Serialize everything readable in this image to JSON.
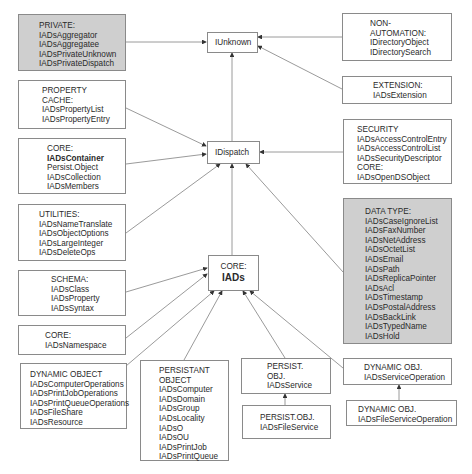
{
  "diagram": {
    "colors": {
      "gray_box": "#cfcfcf",
      "border": "#8a8a8a",
      "line": "#808080"
    },
    "nodes": {
      "iunknown": {
        "lines": [
          "IUnknown"
        ]
      },
      "idispatch": {
        "lines": [
          "IDispatch"
        ]
      },
      "iads": {
        "lines": [
          "CORE:",
          "IADs"
        ]
      },
      "private": {
        "lines": [
          "PRIVATE:",
          "IADsAggregator",
          "IADsAggregatee",
          "IADsPrivateUnknown",
          "IADsPrivateDispatch"
        ]
      },
      "non_automation": {
        "lines": [
          "NON-",
          "AUTOMATION:",
          "IDirectoryObject",
          "IDirectorySearch"
        ]
      },
      "extension": {
        "lines": [
          "EXTENSION:",
          "IADsExtension"
        ]
      },
      "property_cache": {
        "lines": [
          "PROPERTY",
          "CACHE:",
          "IADsPropertyList",
          "IADsPropertyEntry"
        ]
      },
      "core_container": {
        "lines": [
          "CORE:",
          "IADsContainer",
          "Persist.Object",
          "IADsCollection",
          "IADsMembers"
        ]
      },
      "security": {
        "lines": [
          "SECURITY",
          "IADsAccessControlEntry",
          "IADsAccessControlList",
          "IADsSecurityDescriptor",
          "CORE:",
          "IADsOpenDSObject"
        ]
      },
      "utilities": {
        "lines": [
          "UTILITIES:",
          "IADsNameTranslate",
          "IADsObjectOptions",
          "IADsLargeInteger",
          "IADsDeleteOps"
        ]
      },
      "data_type": {
        "lines": [
          "DATA TYPE:",
          "IADsCaseIgnoreList",
          "IADsFaxNumber",
          "IADsNetAddress",
          "IADsOctetList",
          "IADsEmail",
          "IADsPath",
          "IADsReplicaPointer",
          "IADsAcl",
          "IADsTimestamp",
          "IADsPostalAddress",
          "IADsBackLink",
          "IADsTypedName",
          "IADsHold"
        ]
      },
      "schema": {
        "lines": [
          "SCHEMA:",
          "IADsClass",
          "IADsProperty",
          "IADsSyntax"
        ]
      },
      "core_namespace": {
        "lines": [
          "CORE:",
          "IADsNamespace"
        ]
      },
      "dynamic_object": {
        "lines": [
          "DYNAMIC OBJECT",
          "IADsComputerOperations",
          "IADsPrintJobOperations",
          "IADsPrintQueueOperations",
          "IADsFileShare",
          "IADsResource"
        ]
      },
      "persistant_object": {
        "lines": [
          "PERSISTANT",
          "OBJECT",
          "IADsComputer",
          "IADsDomain",
          "IADsGroup",
          "IADsLocality",
          "IADsO",
          "IADsOU",
          "IADsPrintJob",
          "IADsPrintQueue"
        ]
      },
      "persist_service": {
        "lines": [
          "PERSIST.",
          "OBJ.",
          "IADsService"
        ]
      },
      "dynamic_service_op": {
        "lines": [
          "DYNAMIC OBJ.",
          "IADsServiceOperation"
        ]
      },
      "persist_file_service": {
        "lines": [
          "PERSIST.OBJ.",
          "IADsFileService"
        ]
      },
      "dynamic_file_service_op": {
        "lines": [
          "DYNAMIC OBJ.",
          "IADsFileServiceOperation"
        ]
      }
    },
    "edges": [
      {
        "from": "private",
        "to": "iunknown"
      },
      {
        "from": "non_automation",
        "to": "iunknown"
      },
      {
        "from": "extension",
        "to": "iunknown"
      },
      {
        "from": "idispatch",
        "to": "iunknown"
      },
      {
        "from": "property_cache",
        "to": "idispatch"
      },
      {
        "from": "core_container",
        "to": "idispatch"
      },
      {
        "from": "utilities",
        "to": "idispatch"
      },
      {
        "from": "security",
        "to": "idispatch"
      },
      {
        "from": "iads",
        "to": "idispatch"
      },
      {
        "from": "data_type",
        "to": "idispatch"
      },
      {
        "from": "schema",
        "to": "iads"
      },
      {
        "from": "core_namespace",
        "to": "iads"
      },
      {
        "from": "dynamic_object",
        "to": "iads"
      },
      {
        "from": "persistant_object",
        "to": "iads"
      },
      {
        "from": "persist_service",
        "to": "iads"
      },
      {
        "from": "dynamic_service_op",
        "to": "iads"
      },
      {
        "from": "persist_file_service",
        "to": "persist_service"
      },
      {
        "from": "dynamic_file_service_op",
        "to": "dynamic_service_op"
      }
    ]
  }
}
